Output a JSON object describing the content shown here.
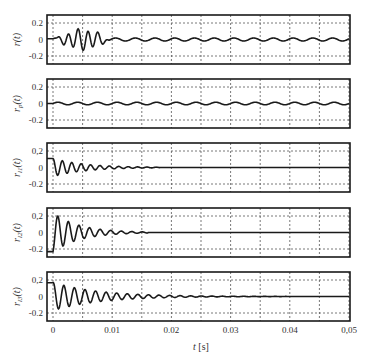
{
  "chart_data": [
    {
      "type": "line",
      "ylabel": "r(t)",
      "ylabel_main": "r",
      "ylabel_sub": "",
      "ylim": [
        -0.25,
        0.25
      ],
      "yticks": [
        "0.2",
        "0",
        "-0.2"
      ],
      "grid": true,
      "description": "Burst of oscillations ~0.002–0.010 s, peak ~0.13, followed by small residual ripple ~±0.02",
      "signal": {
        "kind": "burst",
        "freq": 600,
        "amp": 0.12,
        "t0": 0.0005,
        "t1": 0.0095,
        "tpeak": 0.0045,
        "ripple_amp": 0.018,
        "ripple_freq": 300
      }
    },
    {
      "type": "line",
      "ylabel": "r_p(t)",
      "ylabel_main": "r",
      "ylabel_sub": "p",
      "ylim": [
        -0.25,
        0.25
      ],
      "yticks": [
        "0.2",
        "0",
        "-0.2"
      ],
      "grid": true,
      "description": "Small periodic ripple of amplitude ~0.015 throughout",
      "signal": {
        "kind": "ripple",
        "freq": 300,
        "amp": 0.015
      }
    },
    {
      "type": "line",
      "ylabel": "r_l1(t)",
      "ylabel_main": "r",
      "ylabel_sub": "l1",
      "ylim": [
        -0.25,
        0.25
      ],
      "yticks": [
        "0,2",
        "0",
        "-0.2"
      ],
      "grid": true,
      "description": "Damped oscillation starting ~0.1, decaying to 0 by ~0.017 s",
      "signal": {
        "kind": "damped",
        "freq": 630,
        "amp": 0.11,
        "decay": 190,
        "phase": 1.57,
        "tend": 0.018
      }
    },
    {
      "type": "line",
      "ylabel": "r_l2(t)",
      "ylabel_main": "r",
      "ylabel_sub": "l2",
      "ylim": [
        -0.25,
        0.25
      ],
      "yticks": [
        "0,2",
        "0",
        "-0.2"
      ],
      "grid": true,
      "description": "Starts at -0.22, jumps to peak 0.16, damped oscillation decaying by ~0.014 s",
      "signal": {
        "kind": "damped",
        "freq": 560,
        "amp": 0.24,
        "decay": 230,
        "phase": -1.3,
        "tend": 0.016
      }
    },
    {
      "type": "line",
      "ylabel": "r_l3(t)",
      "ylabel_main": "r",
      "ylabel_sub": "l3",
      "ylim": [
        -0.25,
        0.25
      ],
      "yticks": [
        "0,2",
        "0",
        "-0.2"
      ],
      "grid": true,
      "description": "Damped oscillation starting ~0.16, slower decay, small ripple persisting to ~0.03 s",
      "signal": {
        "kind": "damped",
        "freq": 560,
        "amp": 0.17,
        "decay": 130,
        "phase": 1.4,
        "tend": 0.05
      }
    }
  ],
  "x_axis": {
    "label_main": "t",
    "label_unit": " [s]",
    "xlim": [
      0,
      0.05
    ],
    "ticks": [
      "0",
      "0.01",
      "0.02",
      "0.03",
      "0.04",
      "0,05"
    ],
    "tick_values": [
      0,
      0.01,
      0.02,
      0.03,
      0.04,
      0.05
    ]
  },
  "colors": {
    "line": "#1a1a1a",
    "frame": "#1a1a1a",
    "grid": "#555555"
  }
}
